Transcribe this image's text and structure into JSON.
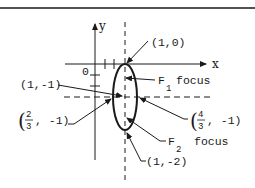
{
  "diagram": {
    "type": "ellipse-graph",
    "axes": {
      "x_label": "x",
      "y_label": "y",
      "origin_label": "0"
    },
    "annotations": {
      "top_vertex": "(1,0)",
      "center": "(1,-1)",
      "left_vertex_open": "(",
      "left_vertex_num": "2",
      "left_vertex_den": "3",
      "left_vertex_rest": ", -1)",
      "right_vertex_open": "(",
      "right_vertex_num": "4",
      "right_vertex_den": "3",
      "right_vertex_rest": ", -1)",
      "bottom_vertex": "(1,-2)",
      "f1_letter": "F",
      "f1_sub": "1",
      "f1_text": "focus",
      "f2_letter": "F",
      "f2_sub": "2",
      "f2_text": "focus"
    },
    "colors": {
      "ink": "#1a1a1a",
      "background": "#ffffff"
    }
  }
}
